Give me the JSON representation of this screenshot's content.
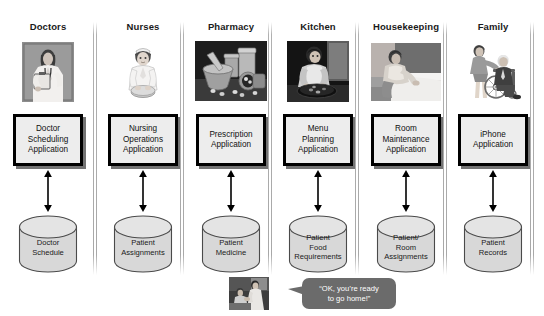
{
  "diagram": {
    "lanes": [
      {
        "header": "Doctors",
        "photo_alt": "doctor-with-clipboard-photo",
        "application": "Doctor\nScheduling\nApplication",
        "database": "Doctor\nSchedule",
        "connector": "double-headed-arrow"
      },
      {
        "header": "Nurses",
        "photo_alt": "nurse-seated-photo",
        "application": "Nursing\nOperations\nApplication",
        "database": "Patient\nAssignments",
        "connector": "double-headed-arrow"
      },
      {
        "header": "Pharmacy",
        "photo_alt": "mortar-pestle-pills-photo",
        "application": "Prescription\nApplication",
        "database": "Patient\nMedicine",
        "connector": "double-headed-arrow"
      },
      {
        "header": "Kitchen",
        "photo_alt": "cook-preparing-food-photo",
        "application": "Menu\nPlanning\nApplication",
        "database": "Patient\nFood\nRequirements",
        "connector": "double-headed-arrow"
      },
      {
        "header": "Housekeeping",
        "photo_alt": "housekeeper-making-bed-photo",
        "application": "Room\nMaintenance\nApplication",
        "database": "Patient/\nRoom\nAssignments",
        "connector": "double-headed-arrow"
      },
      {
        "header": "Family",
        "photo_alt": "family-with-elderly-man-in-wheelchair-photo",
        "application": "iPhone\nApplication",
        "database": "Patient\nRecords",
        "connector": "double-headed-arrow"
      }
    ],
    "footer": {
      "photo_alt": "doctor-with-patient-photo",
      "speech_bubble": "“OK, you’re ready\nto go home!”"
    },
    "colors": {
      "app_box_fill": "#ededed",
      "app_box_border": "#000000",
      "database_fill": "#d8d8d8",
      "database_stroke": "#4a4a4a",
      "divider": "#a8a8a8",
      "bubble_fill": "#6b6b6b",
      "bubble_text": "#ffffff",
      "header_text": "#1a1a1a",
      "background": "#ffffff"
    }
  }
}
